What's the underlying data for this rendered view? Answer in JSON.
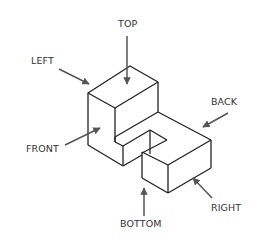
{
  "diagram": {
    "type": "isometric-object-views",
    "line_color": "#222222",
    "arrow_color": "#555555",
    "labels": {
      "top": "TOP",
      "left": "LEFT",
      "back": "BACK",
      "front": "FRONT",
      "bottom": "BOTTOM",
      "right": "RIGHT"
    }
  }
}
